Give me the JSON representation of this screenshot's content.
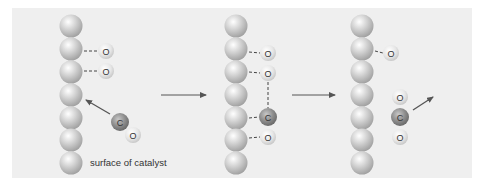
{
  "diagram": {
    "caption": "surface of catalyst",
    "colors": {
      "background": "#efefef",
      "catalyst_sphere": "#c4c4c4",
      "oxygen_atom": "#dedede",
      "carbon_atom": "#8a8a8a",
      "arrow": "#555555"
    },
    "atom_labels": {
      "oxygen": "O",
      "carbon": "C"
    },
    "stages": [
      {
        "id": "stage-1",
        "description": "O atoms adsorbed on catalyst; CO molecule approaching surface",
        "adsorbed": [
          "O",
          "O"
        ],
        "free_molecule": [
          "C",
          "O"
        ]
      },
      {
        "id": "stage-2",
        "description": "CO adsorbed; C bonds toward adsorbed O",
        "adsorbed": [
          "O",
          "O",
          "C",
          "O"
        ]
      },
      {
        "id": "stage-3",
        "description": "CO2 formed and leaving surface; one O remains adsorbed",
        "adsorbed": [
          "O"
        ],
        "free_molecule": [
          "O",
          "C",
          "O"
        ]
      }
    ],
    "transitions": [
      "stage-1 to stage-2",
      "stage-2 to stage-3"
    ]
  }
}
